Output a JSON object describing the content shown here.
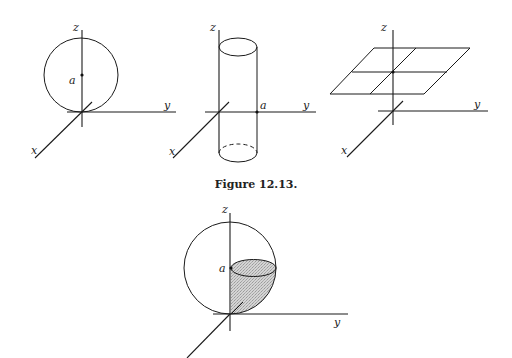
{
  "caption": "Figure 12.13.",
  "figures": [
    {
      "name": "sphere-on-origin",
      "labels": {
        "z": "z",
        "y": "y",
        "x": "x",
        "a": "a"
      },
      "description": "Sphere tangent to xy-plane at origin with center a on z-axis"
    },
    {
      "name": "cylinder",
      "labels": {
        "z": "z",
        "y": "y",
        "x": "x",
        "a": "a",
        "y_left": "y"
      },
      "description": "Vertical cylinder through origin, radius a along y-axis"
    },
    {
      "name": "horizontal-plane",
      "labels": {
        "z": "z",
        "y": "y",
        "x": "x"
      },
      "description": "Horizontal plane with grid, intersecting z-axis"
    },
    {
      "name": "sphere-with-shaded-region",
      "labels": {
        "z": "z",
        "y": "y",
        "a": "a"
      },
      "description": "Sphere with shaded quarter region below disk at height a",
      "shade_color": "#c8c8c8"
    }
  ]
}
